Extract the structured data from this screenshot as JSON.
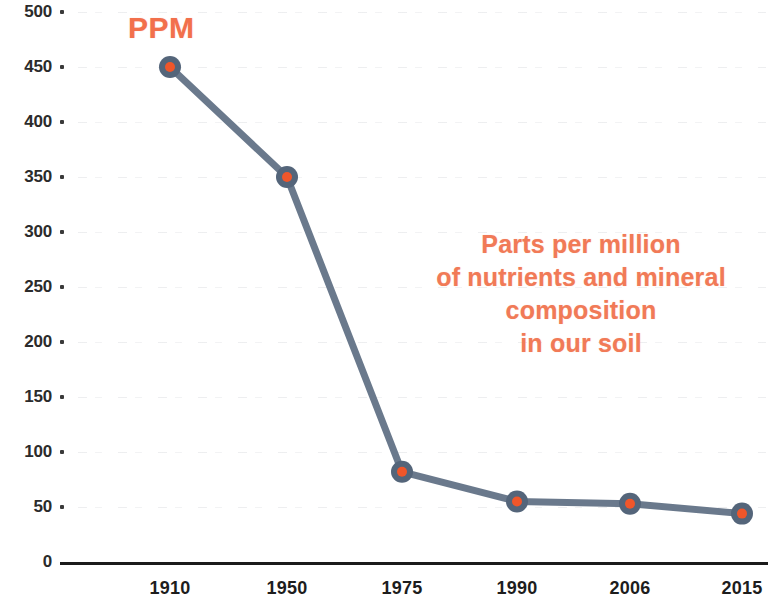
{
  "chart_data": {
    "type": "line",
    "title": "",
    "subtitle": "",
    "xlabel": "",
    "ylabel": "PPM",
    "categories": [
      "1910",
      "1950",
      "1975",
      "1990",
      "2006",
      "2015"
    ],
    "values": [
      450,
      350,
      82,
      55,
      53,
      44
    ],
    "series": [
      {
        "name": "Parts per million of nutrients and mineral composition in our soil",
        "values": [
          450,
          350,
          82,
          55,
          53,
          44
        ]
      }
    ],
    "ylim": [
      0,
      500
    ],
    "ytick_labels": [
      "500",
      "450",
      "400",
      "350",
      "300",
      "250",
      "200",
      "150",
      "100",
      "50",
      "0"
    ],
    "ytick_values": [
      500,
      450,
      400,
      350,
      300,
      250,
      200,
      150,
      100,
      50,
      0
    ],
    "xtick_labels": [
      "1910",
      "1950",
      "1975",
      "1990",
      "2006",
      "2015"
    ],
    "grid": true,
    "legend": "none",
    "annotations": [
      {
        "name": "ppm-axis-label",
        "text": "PPM",
        "color": "#f2704c"
      },
      {
        "name": "description-block",
        "lines": [
          "Parts per million",
          "of nutrients and mineral",
          "composition",
          "in our soil"
        ],
        "color": "#f17a57"
      }
    ],
    "colors": {
      "line": "#5d6e82",
      "marker_ring": "#54657a",
      "marker_center": "#f0562a",
      "axis": "#1b1b1b",
      "tick_text": "#2b2b2b",
      "accent_text": "#f2704c",
      "background": "#ffffff"
    }
  },
  "axis": {
    "y_label_text": "PPM"
  }
}
